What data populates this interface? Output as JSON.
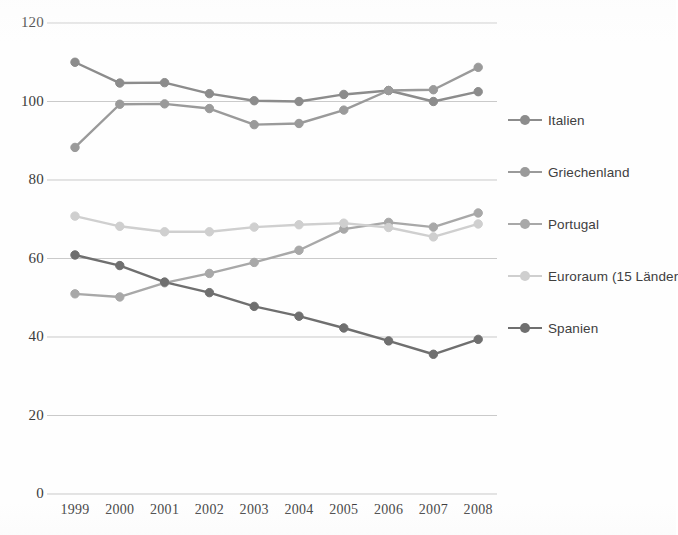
{
  "chart_data": {
    "type": "line",
    "title": "",
    "subtitle": "",
    "xlabel": "",
    "ylabel": "",
    "categories": [
      "1999",
      "2000",
      "2001",
      "2002",
      "2003",
      "2004",
      "2005",
      "2006",
      "2007",
      "2008"
    ],
    "x": [
      1999,
      2000,
      2001,
      2002,
      2003,
      2004,
      2005,
      2006,
      2007,
      2008
    ],
    "ylim": [
      0,
      120
    ],
    "yticks": [
      0,
      20,
      40,
      60,
      80,
      100,
      120
    ],
    "ytick_labels": [
      "0",
      "20",
      "40",
      "60",
      "80",
      "100",
      "120"
    ],
    "grid": "horizontal",
    "legend_position": "right",
    "series": [
      {
        "name": "Italien",
        "color": "#8c8c8c",
        "values": [
          110.0,
          104.7,
          104.8,
          102.0,
          100.2,
          100.0,
          101.8,
          102.8,
          100.0,
          102.5
        ]
      },
      {
        "name": "Griechenland",
        "color": "#9a9a9a",
        "values": [
          88.3,
          99.3,
          99.4,
          98.2,
          94.1,
          94.4,
          97.8,
          102.8,
          103.0,
          108.7
        ]
      },
      {
        "name": "Portugal",
        "color": "#a8a8a8",
        "values": [
          51.0,
          50.2,
          53.8,
          56.2,
          59.0,
          62.1,
          67.5,
          69.2,
          68.0,
          71.6
        ]
      },
      {
        "name": "Euroraum (15 Länder",
        "color": "#cfcfcf",
        "values": [
          70.8,
          68.2,
          66.8,
          66.8,
          68.0,
          68.6,
          69.0,
          67.9,
          65.5,
          68.8
        ]
      },
      {
        "name": "Spanien",
        "color": "#6f6f6f",
        "values": [
          60.9,
          58.2,
          54.0,
          51.3,
          47.8,
          45.3,
          42.3,
          39.0,
          35.6,
          39.4
        ]
      }
    ]
  },
  "axes": {
    "y_labels": [
      "120",
      "100",
      "80",
      "60",
      "40",
      "20",
      "0"
    ],
    "x_labels": [
      "1999",
      "2000",
      "2001",
      "2002",
      "2003",
      "2004",
      "2005",
      "2006",
      "2007",
      "2008"
    ]
  },
  "legend": {
    "items": [
      {
        "label": "Italien",
        "color": "#8c8c8c"
      },
      {
        "label": "Griechenland",
        "color": "#9a9a9a"
      },
      {
        "label": "Portugal",
        "color": "#a8a8a8"
      },
      {
        "label": "Euroraum (15 Länder",
        "color": "#cfcfcf"
      },
      {
        "label": "Spanien",
        "color": "#6f6f6f"
      }
    ]
  },
  "colors": {
    "grid": "#b9b9b9",
    "text": "#3b3b3b",
    "background": "#fefefe"
  }
}
